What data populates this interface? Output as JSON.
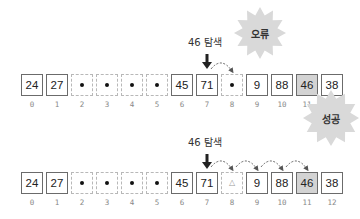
{
  "scenarios": [
    {
      "id": "failure",
      "search_label": "46 탐색",
      "result_label": "오류",
      "cells": [
        {
          "index": "0",
          "value": "24",
          "state": "filled"
        },
        {
          "index": "1",
          "value": "27",
          "state": "filled"
        },
        {
          "index": "2",
          "value": "",
          "state": "deleted-dot"
        },
        {
          "index": "3",
          "value": "",
          "state": "deleted-dot"
        },
        {
          "index": "4",
          "value": "",
          "state": "deleted-dot"
        },
        {
          "index": "5",
          "value": "",
          "state": "deleted-dot"
        },
        {
          "index": "6",
          "value": "45",
          "state": "filled"
        },
        {
          "index": "7",
          "value": "71",
          "state": "filled"
        },
        {
          "index": "8",
          "value": "",
          "state": "deleted-dot"
        },
        {
          "index": "9",
          "value": "9",
          "state": "filled"
        },
        {
          "index": "10",
          "value": "88",
          "state": "filled"
        },
        {
          "index": "11",
          "value": "46",
          "state": "target"
        },
        {
          "index": "12",
          "value": "38",
          "state": "filled"
        }
      ],
      "start_index": 7,
      "probe_path": [
        7,
        8
      ]
    },
    {
      "id": "success",
      "search_label": "46 탐색",
      "result_label": "성공",
      "cells": [
        {
          "index": "0",
          "value": "24",
          "state": "filled"
        },
        {
          "index": "1",
          "value": "27",
          "state": "filled"
        },
        {
          "index": "2",
          "value": "",
          "state": "deleted-dot"
        },
        {
          "index": "3",
          "value": "",
          "state": "deleted-dot"
        },
        {
          "index": "4",
          "value": "",
          "state": "deleted-dot"
        },
        {
          "index": "5",
          "value": "",
          "state": "deleted-dot"
        },
        {
          "index": "6",
          "value": "45",
          "state": "filled"
        },
        {
          "index": "7",
          "value": "71",
          "state": "filled"
        },
        {
          "index": "8",
          "value": "△",
          "state": "tombstone"
        },
        {
          "index": "9",
          "value": "9",
          "state": "filled"
        },
        {
          "index": "10",
          "value": "88",
          "state": "filled"
        },
        {
          "index": "11",
          "value": "46",
          "state": "target"
        },
        {
          "index": "12",
          "value": "38",
          "state": "filled"
        }
      ],
      "start_index": 7,
      "probe_path": [
        7,
        8,
        9,
        10,
        11
      ]
    }
  ],
  "colors": {
    "cell_border": "#6b6b6b",
    "empty_border": "#b8b8b8",
    "target_fill": "#d3d3d3",
    "burst_fill": "#d9d9d9",
    "arrow": "#555555"
  }
}
